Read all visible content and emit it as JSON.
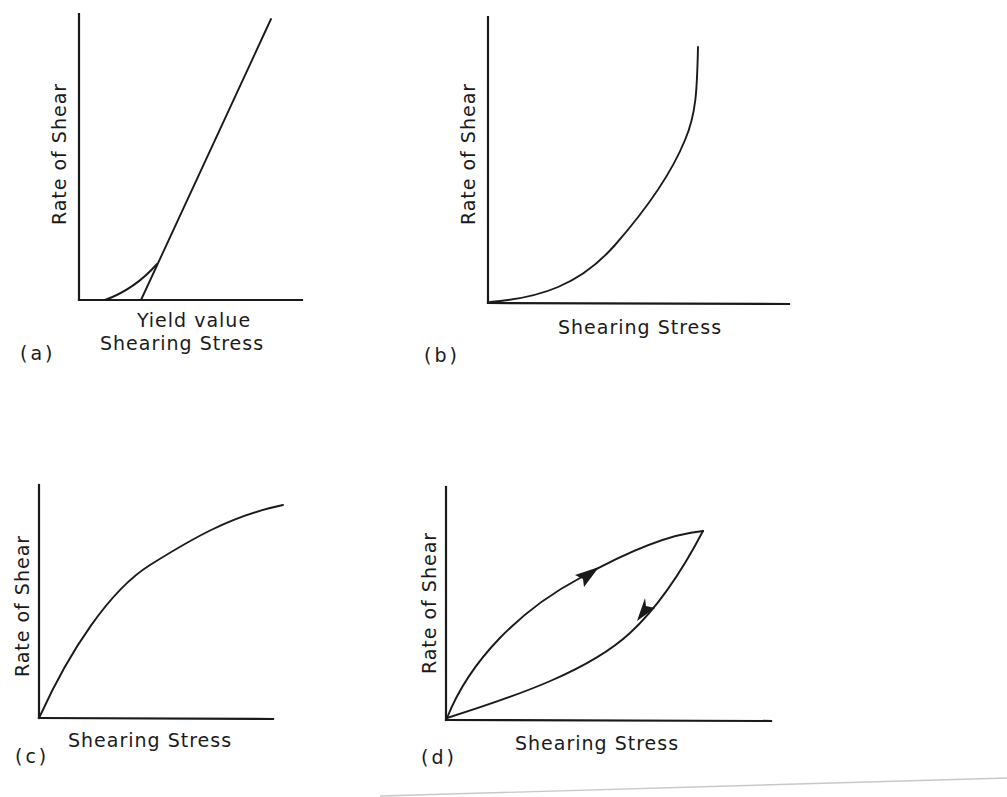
{
  "figure": {
    "panels": [
      {
        "id": "a",
        "tag": "(a)",
        "y_label": "Rate of Shear",
        "x_label": "Shearing Stress",
        "annotation": "Yield value",
        "description": "Plastic flow: curve starting at a positive shearing stress, becoming linear; extrapolated line intercepts axis at yield value"
      },
      {
        "id": "b",
        "tag": "(b)",
        "y_label": "Rate of Shear",
        "x_label": "Shearing Stress",
        "description": "Dilatant flow: rate of shear increases more steeply at higher shearing stress"
      },
      {
        "id": "c",
        "tag": "(c)",
        "y_label": "Rate of Shear",
        "x_label": "Shearing Stress",
        "description": "Pseudoplastic flow: rate of shear rises steeply then levels off"
      },
      {
        "id": "d",
        "tag": "(d)",
        "y_label": "Rate of Shear",
        "x_label": "Shearing Stress",
        "description": "Thixotropic hysteresis loop: up-curve and down-curve with direction arrows"
      }
    ],
    "colors": {
      "ink": "#1a1a1a",
      "background": "#ffffff",
      "scan_line": "#c8c8c8"
    }
  }
}
